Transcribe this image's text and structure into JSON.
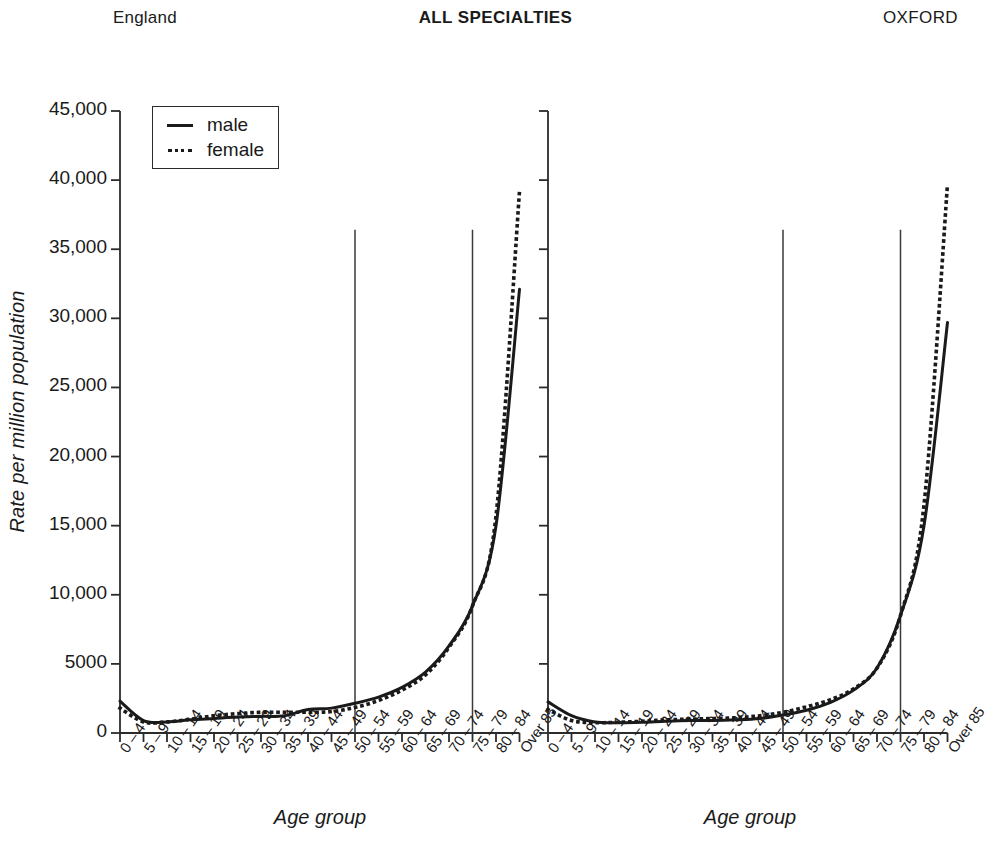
{
  "header": {
    "left": "England",
    "center": "ALL SPECIALTIES",
    "right": "OXFORD"
  },
  "legend": {
    "male_label": "male",
    "female_label": "female",
    "male_style": "solid",
    "female_style": "dotted",
    "position": "top-left of England panel"
  },
  "axes": {
    "ylabel": "Rate per million population",
    "xlabel": "Age group",
    "yticks": [
      "0",
      "5000",
      "10,000",
      "15,000",
      "20,000",
      "25,000",
      "30,000",
      "35,000",
      "40,000",
      "45,000"
    ],
    "ytick_values": [
      0,
      5000,
      10000,
      15000,
      20000,
      25000,
      30000,
      35000,
      40000,
      45000
    ],
    "ylim": [
      0,
      45000
    ],
    "categories": [
      "0 – 4",
      "5 – 9",
      "10 – 14",
      "15 – 19",
      "20 – 24",
      "25 – 29",
      "30 – 34",
      "35 – 39",
      "40 – 44",
      "45 – 49",
      "50 – 54",
      "55 – 59",
      "60 – 64",
      "65 – 69",
      "70 – 74",
      "75 – 79",
      "80 – 84",
      "Over 85"
    ]
  },
  "colors": {
    "line": "#1a1a1a",
    "axis": "#2b2b2b",
    "marker_line": "#3a3a3a",
    "background": "#ffffff"
  },
  "chart_data": [
    {
      "type": "line",
      "title": "England",
      "subtitle": "ALL SPECIALTIES",
      "xlabel": "Age group",
      "ylabel": "Rate per million population",
      "ylim": [
        0,
        45000
      ],
      "grid": false,
      "legend_position": "upper left",
      "categories": [
        "0 – 4",
        "5 – 9",
        "10 – 14",
        "15 – 19",
        "20 – 24",
        "25 – 29",
        "30 – 34",
        "35 – 39",
        "40 – 44",
        "45 – 49",
        "50 – 54",
        "55 – 59",
        "60 – 64",
        "65 – 69",
        "70 – 74",
        "75 – 79",
        "80 – 84",
        "Over 85"
      ],
      "series": [
        {
          "name": "male",
          "style": "solid",
          "values": [
            2300,
            900,
            800,
            950,
            1050,
            1150,
            1200,
            1250,
            1700,
            1800,
            2150,
            2600,
            3300,
            4400,
            6300,
            9200,
            15000,
            32100
          ]
        },
        {
          "name": "female",
          "style": "dotted",
          "values": [
            1800,
            800,
            800,
            1000,
            1250,
            1400,
            1500,
            1500,
            1500,
            1550,
            1850,
            2350,
            3100,
            4200,
            6200,
            9200,
            15700,
            39200
          ]
        }
      ],
      "annotations": [
        {
          "kind": "vertical-line",
          "at_category": "50 – 54",
          "top_value": 36400,
          "bottom_value": 0
        },
        {
          "kind": "vertical-line",
          "at_category": "75 – 79",
          "top_value": 36400,
          "bottom_value": 0
        }
      ]
    },
    {
      "type": "line",
      "title": "OXFORD",
      "subtitle": "ALL SPECIALTIES",
      "xlabel": "Age group",
      "ylabel": "Rate per million population",
      "ylim": [
        0,
        45000
      ],
      "grid": false,
      "legend_position": "none",
      "categories": [
        "0 – 4",
        "5 – 9",
        "10 – 14",
        "15 – 19",
        "20 – 24",
        "25 – 29",
        "30 – 34",
        "35 – 39",
        "40 – 44",
        "45 – 49",
        "50 – 54",
        "55 – 59",
        "60 – 64",
        "65 – 69",
        "70 – 74",
        "75 – 79",
        "80 – 84",
        "Over 85"
      ],
      "series": [
        {
          "name": "male",
          "style": "solid",
          "values": [
            2250,
            1250,
            800,
            750,
            780,
            850,
            900,
            900,
            950,
            1050,
            1300,
            1650,
            2200,
            3100,
            4700,
            8500,
            15000,
            29700
          ]
        },
        {
          "name": "female",
          "style": "dotted",
          "values": [
            1700,
            900,
            750,
            780,
            850,
            950,
            1000,
            1050,
            1100,
            1250,
            1500,
            1900,
            2400,
            3200,
            4700,
            8500,
            16500,
            39700
          ]
        }
      ],
      "annotations": [
        {
          "kind": "vertical-line",
          "at_category": "50 – 54",
          "top_value": 36400,
          "bottom_value": 0
        },
        {
          "kind": "vertical-line",
          "at_category": "75 – 79",
          "top_value": 36400,
          "bottom_value": 0
        }
      ]
    }
  ]
}
